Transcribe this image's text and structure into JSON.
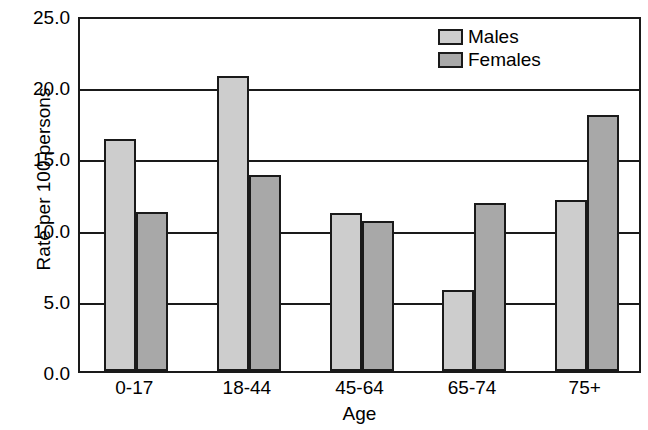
{
  "chart_data": {
    "type": "bar",
    "title": "",
    "xlabel": "Age",
    "ylabel": "Rate per 100 persons",
    "categories": [
      "0-17",
      "18-44",
      "45-64",
      "65-74",
      "75+"
    ],
    "series": [
      {
        "name": "Males",
        "color": "#cdcdcd",
        "values": [
          16.3,
          20.7,
          11.1,
          5.7,
          12.0
        ]
      },
      {
        "name": "Females",
        "color": "#a8a8a8",
        "values": [
          11.2,
          13.8,
          10.5,
          11.8,
          18.0
        ]
      }
    ],
    "ylim": [
      0.0,
      25.0
    ],
    "ytick_labels": [
      "0.0",
      "5.0",
      "10.0",
      "15.0",
      "20.0",
      "25.0"
    ],
    "ytick_values": [
      0.0,
      5.0,
      10.0,
      15.0,
      20.0,
      25.0
    ],
    "grid": "horizontal",
    "legend_position": "top-right",
    "frame_color": "#1a1a1a"
  }
}
